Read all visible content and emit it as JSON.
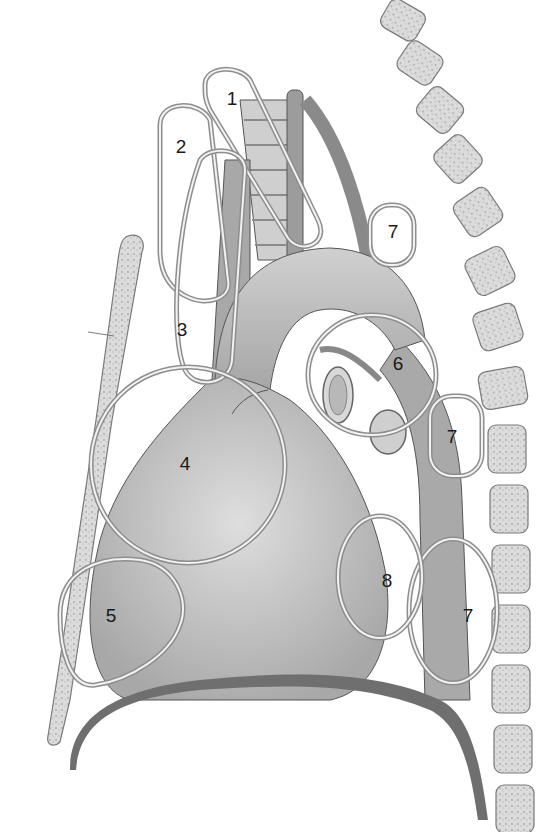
{
  "diagram": {
    "colors": {
      "background": "#ffffff",
      "organ_fill": "#b9b9b9",
      "organ_dark": "#9a9a9a",
      "bone_fill": "#d6d6d6",
      "ring_stroke": "#8e8e8e",
      "diaphragm": "#6f6f6f",
      "label_text": "#1a1a1a"
    },
    "labels": [
      {
        "id": "1",
        "text": "1",
        "x": 232,
        "y": 100
      },
      {
        "id": "2",
        "text": "2",
        "x": 181,
        "y": 148
      },
      {
        "id": "3",
        "text": "3",
        "x": 182,
        "y": 331
      },
      {
        "id": "4",
        "text": "4",
        "x": 185,
        "y": 465
      },
      {
        "id": "5",
        "text": "5",
        "x": 111,
        "y": 617
      },
      {
        "id": "6",
        "text": "6",
        "x": 398,
        "y": 365
      },
      {
        "id": "7a",
        "text": "7",
        "x": 393,
        "y": 233
      },
      {
        "id": "7b",
        "text": "7",
        "x": 452,
        "y": 438
      },
      {
        "id": "7c",
        "text": "7",
        "x": 468,
        "y": 617
      },
      {
        "id": "8",
        "text": "8",
        "x": 387,
        "y": 582
      }
    ]
  }
}
